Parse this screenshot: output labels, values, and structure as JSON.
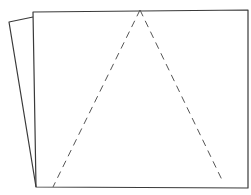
{
  "diagram": {
    "colors": {
      "background": "#ffffff",
      "front_sheet_stroke": "#3a3a3a",
      "back_sheet_stroke": "#3a3a3a",
      "triangle_stroke": "#555555"
    },
    "back_sheet": {
      "points": "33,17 9,22 36,187"
    },
    "front_sheet": {
      "points": "33,12 248,10 248,188 36,187"
    },
    "triangle": {
      "left_edge": {
        "x1": 140,
        "y1": 10,
        "x2": 53,
        "y2": 187
      },
      "right_edge": {
        "x1": 140,
        "y1": 10,
        "x2": 223,
        "y2": 182
      }
    }
  }
}
